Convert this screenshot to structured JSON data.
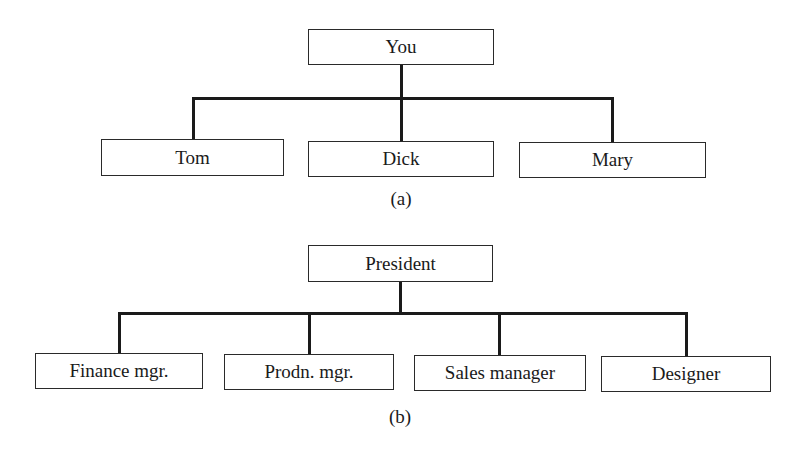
{
  "diagram_a": {
    "caption": "(a)",
    "root": {
      "label": "You"
    },
    "children": [
      {
        "label": "Tom"
      },
      {
        "label": "Dick"
      },
      {
        "label": "Mary"
      }
    ]
  },
  "diagram_b": {
    "caption": "(b)",
    "root": {
      "label": "President"
    },
    "children": [
      {
        "label": "Finance mgr."
      },
      {
        "label": "Prodn. mgr."
      },
      {
        "label": "Sales manager"
      },
      {
        "label": "Designer"
      }
    ]
  }
}
